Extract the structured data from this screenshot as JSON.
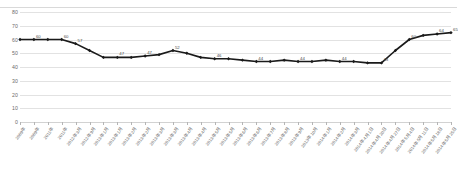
{
  "chart": {
    "title": "",
    "type": "line"
  },
  "chart_data": {
    "type": "line",
    "title": "",
    "subtitle": "",
    "xlabel": "",
    "ylabel": "",
    "ylim": [
      0,
      80
    ],
    "yticks": [
      0,
      10,
      20,
      30,
      40,
      50,
      60,
      70,
      80
    ],
    "ytick_labels": [
      "0",
      "10",
      "20",
      "30",
      "40",
      "50",
      "60",
      "70",
      "80"
    ],
    "grid": true,
    "legend": "none",
    "marker": "diamond",
    "line_color": "#1a1a1a",
    "grid_color": "#e2e2e2",
    "label_color": "#4a4a4a",
    "categories": [
      "2009年",
      "2009年",
      "2011年",
      "2011年",
      "2012年 3月",
      "2012年 9月",
      "2013年 1月",
      "2013年 1月",
      "2013年 2月",
      "2013年 2月",
      "2013年 3月",
      "2013年 3月",
      "2013年 4月",
      "2013年 4月",
      "2013年 5月",
      "2013年 5月",
      "2013年 6月",
      "2013年 6月",
      "2013年 7月",
      "2013年 8月",
      "2013年 9月",
      "2013年 10月",
      "2014年 1月",
      "2014年 2月",
      "2014年 3月",
      "2014年 4月 1日",
      "2014年 4月 20日",
      "2014年 4月 27日",
      "2014年 5月 4日",
      "2014年 5月 11日",
      "2014年 5月 18日",
      "2014年 5月 25日"
    ],
    "values": [
      60,
      60,
      60,
      60,
      57,
      52,
      47,
      47,
      47,
      48,
      49,
      52,
      50,
      47,
      46,
      46,
      45,
      44,
      44,
      45,
      44,
      44,
      45,
      44,
      44,
      43,
      43,
      52,
      60,
      63,
      64,
      65
    ],
    "point_labels": [
      {
        "index": 1,
        "text": "60"
      },
      {
        "index": 3,
        "text": "60"
      },
      {
        "index": 4,
        "text": "57"
      },
      {
        "index": 7,
        "text": "47"
      },
      {
        "index": 9,
        "text": "47"
      },
      {
        "index": 11,
        "text": "52"
      },
      {
        "index": 14,
        "text": "46"
      },
      {
        "index": 17,
        "text": "44"
      },
      {
        "index": 20,
        "text": "44"
      },
      {
        "index": 23,
        "text": "44"
      },
      {
        "index": 26,
        "text": "43"
      },
      {
        "index": 28,
        "text": "60"
      },
      {
        "index": 30,
        "text": "64"
      },
      {
        "index": 31,
        "text": "65"
      }
    ]
  }
}
